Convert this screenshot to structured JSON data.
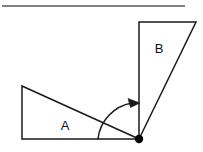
{
  "figure": {
    "background_color": "#ffffff",
    "stroke_color": "#1a1a1a",
    "accent_color": "#000000",
    "width": 203,
    "height": 152
  },
  "top_rule": {
    "name": "horizontal-rule",
    "x1": 2,
    "y1": 6,
    "x2": 185,
    "y2": 6,
    "stroke_width": 1.6,
    "color": "#555a60"
  },
  "triangle_a": {
    "label": "A",
    "label_x": 65,
    "label_y": 127,
    "points": "22,86 22,139 139,139",
    "vertices": [
      {
        "name": "top-left",
        "x": 22,
        "y": 86
      },
      {
        "name": "bottom-left-right-angle",
        "x": 22,
        "y": 139
      },
      {
        "name": "shared-pivot",
        "x": 139,
        "y": 139
      }
    ],
    "stroke_width": 1.5,
    "fill": "none"
  },
  "triangle_b": {
    "label": "B",
    "label_x": 159,
    "label_y": 50,
    "points": "139,22 196,22 139,139",
    "vertices": [
      {
        "name": "top-left-right-angle",
        "x": 139,
        "y": 22
      },
      {
        "name": "top-right",
        "x": 196,
        "y": 22
      },
      {
        "name": "shared-pivot",
        "x": 139,
        "y": 139
      }
    ],
    "stroke_width": 1.5,
    "fill": "none"
  },
  "pivot_point": {
    "name": "shared-vertex-dot",
    "cx": 139,
    "cy": 139,
    "r": 4.2,
    "fill": "#000000"
  },
  "rotation_arrow": {
    "name": "rotation-arc",
    "start_x": 98,
    "start_y": 139,
    "end_x": 136,
    "end_y": 103,
    "radius": 41,
    "sweep": "counterclockwise",
    "arrow_direction": "right",
    "arrow_tip_x": 140,
    "arrow_tip_y": 103,
    "stroke_width": 1.5,
    "path": "M 98 139 A 41 41 0 0 1 132 103"
  }
}
